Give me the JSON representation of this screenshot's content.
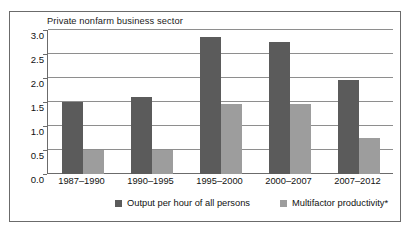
{
  "chart_data": {
    "type": "bar",
    "title": "Private nonfarm business sector",
    "xlabel": "",
    "ylabel": "",
    "ylim": [
      0.0,
      3.0
    ],
    "yticks": [
      "0.0",
      "0.5",
      "1.0",
      "1.5",
      "2.0",
      "2.5",
      "3.0"
    ],
    "ytick_values": [
      0.0,
      0.5,
      1.0,
      1.5,
      2.0,
      2.5,
      3.0
    ],
    "grid": "horizontal",
    "legend_position": "bottom",
    "categories": [
      "1987–1990",
      "1990–1995",
      "1995–2000",
      "2000–2007",
      "2007–2012"
    ],
    "series": [
      {
        "name": "Output per hour of all persons",
        "color": "#5b5b5b",
        "values": [
          1.5,
          1.6,
          2.85,
          2.75,
          1.95
        ]
      },
      {
        "name": "Multifactor productivity*",
        "color": "#9d9d9d",
        "values": [
          0.5,
          0.5,
          1.45,
          1.45,
          0.75
        ]
      }
    ]
  },
  "legend": {
    "items": [
      {
        "label": "Output per hour of all persons"
      },
      {
        "label": "Multifactor productivity*"
      }
    ]
  },
  "colors": {
    "series_dark": "#5b5b5b",
    "series_light": "#9d9d9d",
    "gridline": "#8e8e8e",
    "axis": "#6b6b6b",
    "background": "#ffffff",
    "text": "#111111"
  }
}
